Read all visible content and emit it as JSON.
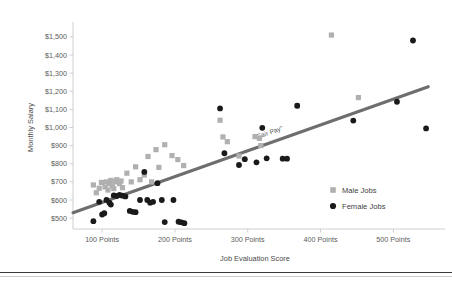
{
  "chart_data": {
    "type": "scatter",
    "title": "",
    "xlabel": "Job Evaluation Score",
    "ylabel": "Monthly Salary",
    "xlim": [
      60,
      560
    ],
    "ylim": [
      440,
      1560
    ],
    "grid": false,
    "xticks": [
      100,
      200,
      300,
      400,
      500
    ],
    "xticklabels": [
      "100 Points",
      "200 Points",
      "300 Points",
      "400 Points",
      "500 Points"
    ],
    "yticks": [
      500,
      600,
      700,
      800,
      900,
      1000,
      1100,
      1200,
      1300,
      1400,
      1500
    ],
    "yticklabels": [
      "$500",
      "$600",
      "$700",
      "$800",
      "$900",
      "$1,000",
      "$1,100",
      "$1,200",
      "$1,300",
      "$1,400",
      "$1,500"
    ],
    "legend_position": "right-middle",
    "series": [
      {
        "name": "Male Jobs",
        "marker": "square",
        "color": "#b0b0b0",
        "points": [
          [
            88,
            683
          ],
          [
            92,
            640
          ],
          [
            96,
            665
          ],
          [
            99,
            697
          ],
          [
            104,
            672
          ],
          [
            106,
            700
          ],
          [
            108,
            655
          ],
          [
            110,
            690
          ],
          [
            112,
            708
          ],
          [
            114,
            678
          ],
          [
            116,
            663
          ],
          [
            118,
            700
          ],
          [
            120,
            712
          ],
          [
            124,
            690
          ],
          [
            126,
            705
          ],
          [
            128,
            668
          ],
          [
            134,
            748
          ],
          [
            140,
            700
          ],
          [
            146,
            783
          ],
          [
            152,
            712
          ],
          [
            158,
            738
          ],
          [
            163,
            840
          ],
          [
            168,
            700
          ],
          [
            174,
            878
          ],
          [
            178,
            780
          ],
          [
            186,
            905
          ],
          [
            196,
            845
          ],
          [
            204,
            823
          ],
          [
            212,
            790
          ],
          [
            262,
            1040
          ],
          [
            266,
            948
          ],
          [
            272,
            922
          ],
          [
            288,
            843
          ],
          [
            310,
            950
          ],
          [
            316,
            940
          ],
          [
            318,
            900
          ],
          [
            368,
            1120
          ],
          [
            415,
            1510
          ],
          [
            452,
            1165
          ]
        ]
      },
      {
        "name": "Female Jobs",
        "marker": "circle",
        "color": "#1a1a1a",
        "points": [
          [
            88,
            483
          ],
          [
            96,
            590
          ],
          [
            100,
            520
          ],
          [
            103,
            527
          ],
          [
            106,
            600
          ],
          [
            110,
            585
          ],
          [
            112,
            575
          ],
          [
            116,
            625
          ],
          [
            120,
            622
          ],
          [
            124,
            628
          ],
          [
            128,
            624
          ],
          [
            132,
            620
          ],
          [
            138,
            540
          ],
          [
            142,
            535
          ],
          [
            146,
            533
          ],
          [
            152,
            600
          ],
          [
            158,
            755
          ],
          [
            162,
            600
          ],
          [
            166,
            585
          ],
          [
            170,
            590
          ],
          [
            176,
            693
          ],
          [
            182,
            600
          ],
          [
            186,
            478
          ],
          [
            198,
            600
          ],
          [
            205,
            480
          ],
          [
            209,
            477
          ],
          [
            213,
            472
          ],
          [
            262,
            1105
          ],
          [
            268,
            858
          ],
          [
            288,
            793
          ],
          [
            296,
            825
          ],
          [
            312,
            808
          ],
          [
            320,
            998
          ],
          [
            326,
            830
          ],
          [
            348,
            828
          ],
          [
            354,
            828
          ],
          [
            368,
            1120
          ],
          [
            445,
            1038
          ],
          [
            505,
            1142
          ],
          [
            527,
            1480
          ],
          [
            545,
            995
          ]
        ]
      }
    ],
    "trendline": {
      "label": "“Fair Pay”",
      "color": "#6e6e6e",
      "x_start": 60,
      "y_start": 530,
      "x_end": 548,
      "y_end": 1225
    }
  },
  "legend": {
    "items": [
      {
        "label": "Male Jobs",
        "marker": "square-marker",
        "color": "#b0b0b0"
      },
      {
        "label": "Female Jobs",
        "marker": "circle-marker",
        "color": "#1a1a1a"
      }
    ]
  }
}
